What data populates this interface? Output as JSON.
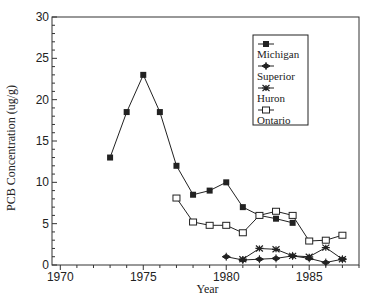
{
  "chart_data": {
    "type": "line",
    "title": "",
    "xlabel": "Year",
    "ylabel": "PCB Concentration (ug/g)",
    "xlim": [
      1969.5,
      1988
    ],
    "ylim": [
      0,
      30
    ],
    "x_ticks": [
      1970,
      1975,
      1980,
      1985
    ],
    "x_minor_step": 1,
    "y_ticks": [
      0,
      5,
      10,
      15,
      20,
      25,
      30
    ],
    "y_minor_step": 1,
    "grid": false,
    "legend_position": "upper right (inside)",
    "series": [
      {
        "name": "Michigan",
        "marker": "filled-square",
        "x": [
          1973,
          1974,
          1975,
          1976,
          1977,
          1978,
          1979,
          1980,
          1981,
          1982,
          1983,
          1984
        ],
        "values": [
          13,
          18.5,
          23,
          18.5,
          12,
          8.5,
          9,
          10,
          7,
          6,
          5.6,
          5.1
        ]
      },
      {
        "name": "Superior",
        "marker": "filled-diamond-cross",
        "x": [
          1980,
          1981,
          1982,
          1983,
          1984,
          1985,
          1986,
          1987
        ],
        "values": [
          1.0,
          0.6,
          0.7,
          0.8,
          1.1,
          0.8,
          0.3,
          0.7
        ]
      },
      {
        "name": "Huron",
        "marker": "asterisk",
        "x": [
          1981,
          1982,
          1983,
          1984,
          1985,
          1986,
          1987
        ],
        "values": [
          0.7,
          2.0,
          1.9,
          1.1,
          1.0,
          2.1,
          0.7
        ]
      },
      {
        "name": "Ontario",
        "marker": "open-square",
        "x": [
          1977,
          1978,
          1979,
          1980,
          1981,
          1982,
          1983,
          1984,
          1985,
          1986,
          1987
        ],
        "values": [
          8.1,
          5.2,
          4.8,
          4.8,
          3.9,
          6.0,
          6.5,
          6.0,
          2.9,
          3.0,
          3.6
        ]
      }
    ]
  },
  "colors": {
    "line": "#222222",
    "axis": "#333333",
    "background": "#ffffff"
  }
}
